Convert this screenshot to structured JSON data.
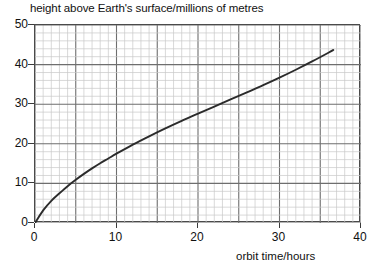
{
  "chart_data": {
    "type": "line",
    "title": "",
    "xlabel": "orbit time/hours",
    "ylabel": "height above Earth's surface/millions of metres",
    "xlim": [
      0,
      40
    ],
    "ylim": [
      0,
      50
    ],
    "xticks": [
      0,
      10,
      20,
      30,
      40
    ],
    "yticks": [
      0,
      10,
      20,
      30,
      40,
      50
    ],
    "xtick_labels": [
      "0",
      "10",
      "20",
      "30",
      "40"
    ],
    "ytick_labels": [
      "0",
      "10",
      "20",
      "30",
      "40",
      "50"
    ],
    "grid": true,
    "grid_minor_x_step": 1,
    "grid_minor_y_step": 2,
    "grid_major_x_step": 5,
    "grid_major_y_step": 10,
    "legend": null,
    "series": [
      {
        "name": "orbit height curve",
        "color": "#2b2b2b",
        "x": [
          0,
          1,
          2,
          3,
          4,
          5,
          6,
          7,
          8,
          9,
          10,
          12,
          14,
          16,
          18,
          20,
          22,
          24,
          26,
          28,
          30,
          32,
          34,
          36,
          36.6
        ],
        "y": [
          0,
          3.2,
          5.6,
          7.5,
          9.3,
          10.9,
          12.4,
          13.8,
          15.1,
          16.3,
          17.5,
          19.8,
          21.9,
          23.9,
          25.8,
          27.6,
          29.4,
          31.2,
          33.0,
          34.8,
          36.7,
          38.7,
          40.8,
          43.0,
          43.7
        ]
      }
    ],
    "colors": {
      "curve": "#2b2b2b",
      "grid_minor": "#c9c9c9",
      "grid_major": "#6e6e6e",
      "frame": "#4a4a4a",
      "text": "#111111",
      "background": "#ffffff"
    }
  },
  "labels": {
    "y_axis_title": "height above Earth's surface/millions of metres",
    "x_axis_title": "orbit time/hours"
  }
}
